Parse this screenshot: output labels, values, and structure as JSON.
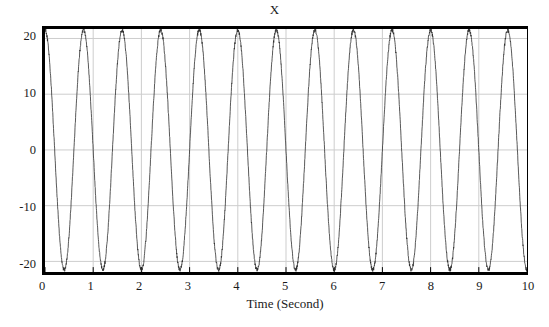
{
  "chart_data": {
    "type": "line",
    "title": "X",
    "subtitle": "",
    "xlabel": "Time (Second)",
    "ylabel": "",
    "xlim": [
      0,
      10
    ],
    "ylim": [
      -21.9,
      21.7
    ],
    "xticks": [
      0,
      1,
      2,
      3,
      4,
      5,
      6,
      7,
      8,
      9,
      10
    ],
    "xtick_labels": [
      "0",
      "1",
      "2",
      "3",
      "4",
      "5",
      "6",
      "7",
      "8",
      "9",
      "10"
    ],
    "yticks": [
      20,
      10,
      0,
      -10,
      -20
    ],
    "ytick_labels": [
      "20",
      "10",
      "0",
      "-10",
      "-20"
    ],
    "grid": true,
    "grid_color": "#cccccc",
    "legend": false,
    "legend_position": "none",
    "line_color": "#2b2b2b",
    "line_width": 0.8,
    "frame_color": "#000000",
    "background_color": "#ffffff",
    "series": [
      {
        "name": "X",
        "waveform": "sinusoid",
        "amplitude": 21.5,
        "frequency_hz": 1.25,
        "period_s": 0.8,
        "phase_deg": 90,
        "offset": 0,
        "noise_amplitude": 0.35,
        "cycles_visible": 12.5,
        "peak_times": [
          0.0,
          0.8,
          1.6,
          2.4,
          3.2,
          4.0,
          4.8,
          5.6,
          6.4,
          7.2,
          8.0,
          8.8,
          9.6
        ],
        "trough_times": [
          0.4,
          1.2,
          2.0,
          2.8,
          3.6,
          4.4,
          5.2,
          6.0,
          6.8,
          7.6,
          8.4,
          9.2,
          10.0
        ],
        "peak_value": 21.5,
        "trough_value": -21.5,
        "samples_per_second": 100
      }
    ]
  },
  "axes": {
    "title": "X",
    "xlabel": "Time (Second)"
  }
}
